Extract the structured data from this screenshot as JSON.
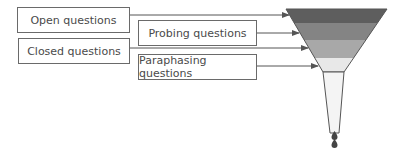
{
  "diagram": {
    "boxes": [
      {
        "label": "Open questions"
      },
      {
        "label": "Probing questions"
      },
      {
        "label": "Closed questions"
      },
      {
        "label": "Paraphasing questions"
      }
    ],
    "funnel": {
      "bands": [
        {
          "color": "#5e5e5e"
        },
        {
          "color": "#848484"
        },
        {
          "color": "#a8a8a8"
        },
        {
          "color": "#e8e8e8"
        }
      ],
      "outline_color": "#555555",
      "neck_color": "#f4f4f4",
      "drop_color": "#444444"
    }
  }
}
